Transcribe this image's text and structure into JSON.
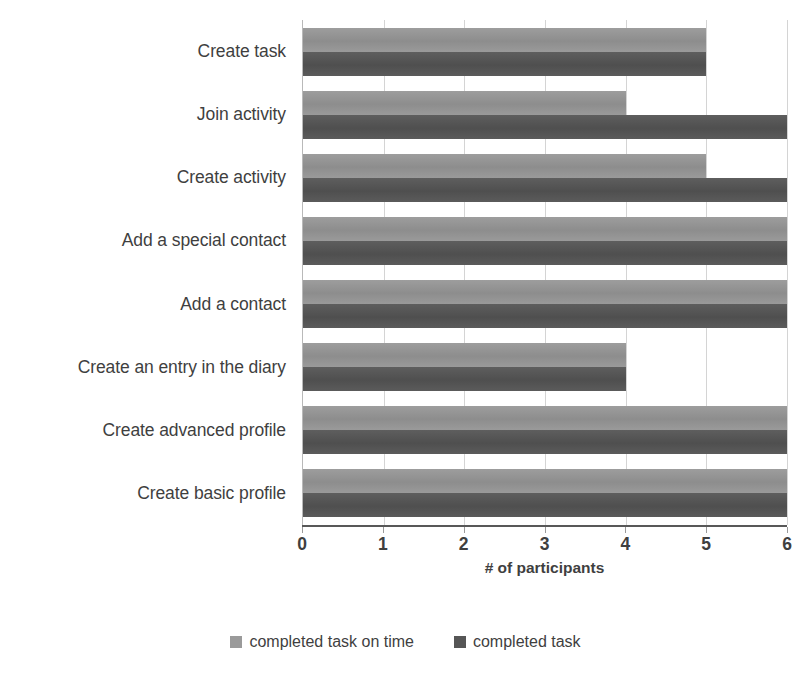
{
  "chart_data": {
    "type": "bar",
    "orientation": "horizontal",
    "title": "",
    "xlabel": "# of participants",
    "ylabel": "",
    "xlim": [
      0,
      6
    ],
    "xticks": [
      0,
      1,
      2,
      3,
      4,
      5,
      6
    ],
    "xtick_labels": [
      "0",
      "1",
      "2",
      "3",
      "4",
      "5",
      "6"
    ],
    "grid": true,
    "grid_axis": "x",
    "legend_position": "bottom",
    "categories": [
      "Create task",
      "Join activity",
      "Create activity",
      "Add a special contact",
      "Add a contact",
      "Create an entry in the diary",
      "Create advanced profile",
      "Create basic profile"
    ],
    "series": [
      {
        "name": "completed task on time",
        "color": "#9a9a9a",
        "values": [
          5,
          4,
          5,
          6,
          6,
          4,
          6,
          6
        ]
      },
      {
        "name": "completed task",
        "color": "#565656",
        "values": [
          5,
          6,
          6,
          6,
          6,
          4,
          6,
          6
        ]
      }
    ]
  },
  "legend": {
    "items": [
      {
        "label": "completed task on time",
        "swatch": "legend-swatch-light"
      },
      {
        "label": "completed task",
        "swatch": "legend-swatch-dark"
      }
    ]
  },
  "axis": {
    "x_title": "# of participants"
  }
}
